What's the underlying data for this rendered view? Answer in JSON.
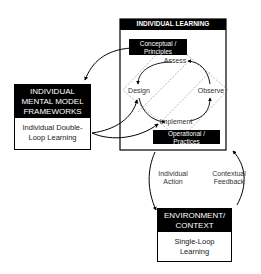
{
  "individual_learning": {
    "title": "INDIVIDUAL LEARNING",
    "conceptual": "Conceptual / Principles",
    "operational": "Operational / Practices",
    "cycle": {
      "assess": "Assess",
      "observe": "Observe",
      "implement": "Implement",
      "design": "Design"
    }
  },
  "mental_models": {
    "title": "INDIVIDUAL MENTAL MODEL FRAMEWORKS",
    "body": "Individual Double-Loop Learning"
  },
  "environment": {
    "title": "ENVIRONMENT/ CONTEXT",
    "body": "Single-Loop Learning"
  },
  "arrows": {
    "individual_action": "Individual Action",
    "contextual_feedback": "Contextual Feedback"
  }
}
